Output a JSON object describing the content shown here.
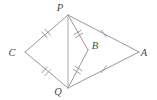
{
  "figure": {
    "background_color": "#ffffff",
    "line_color": "#8d8d92",
    "label_color": "#4a4a4f",
    "width": 157,
    "height": 100,
    "points": [
      {
        "id": "P",
        "label": "P",
        "x": 68,
        "y": 15,
        "label_x": 60,
        "label_y": 11
      },
      {
        "id": "C",
        "label": "C",
        "x": 25,
        "y": 52,
        "label_x": 12,
        "label_y": 56
      },
      {
        "id": "A",
        "label": "A",
        "x": 139,
        "y": 52,
        "label_x": 144,
        "label_y": 56
      },
      {
        "id": "Q",
        "label": "Q",
        "x": 68,
        "y": 88,
        "label_x": 58,
        "label_y": 95
      },
      {
        "id": "B",
        "label": "B",
        "x": 88,
        "y": 50,
        "label_x": 95,
        "label_y": 49
      }
    ],
    "segments": [
      {
        "id": "CP",
        "from": "C",
        "to": "P",
        "ticks": 2
      },
      {
        "id": "CQ",
        "from": "C",
        "to": "Q",
        "ticks": 2
      },
      {
        "id": "PA",
        "from": "P",
        "to": "A",
        "ticks": 1
      },
      {
        "id": "QA",
        "from": "Q",
        "to": "A",
        "ticks": 1
      },
      {
        "id": "PB",
        "from": "P",
        "to": "B",
        "ticks": 2
      },
      {
        "id": "BQ",
        "from": "B",
        "to": "Q",
        "ticks": 2
      },
      {
        "id": "PQ",
        "from": "P",
        "to": "Q",
        "ticks": 0
      }
    ]
  }
}
